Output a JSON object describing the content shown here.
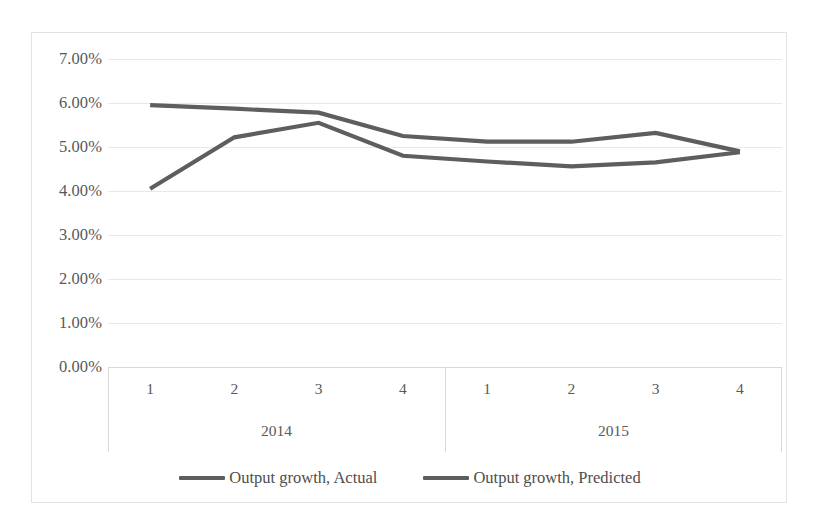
{
  "chart_data": {
    "type": "line",
    "title": "",
    "subtitle": "",
    "xlabel": "",
    "ylabel": "",
    "grid": true,
    "legend_position": "bottom",
    "ylim": [
      0,
      7
    ],
    "ytick_labels": [
      "7.00%",
      "6.00%",
      "5.00%",
      "4.00%",
      "3.00%",
      "2.00%",
      "1.00%",
      "0.00%"
    ],
    "ytick_values": [
      7,
      6,
      5,
      4,
      3,
      2,
      1,
      0
    ],
    "ytick_format": "percent",
    "categories": [
      "1",
      "2",
      "3",
      "4",
      "1",
      "2",
      "3",
      "4"
    ],
    "category_groups": [
      {
        "label": "2014",
        "span": 4
      },
      {
        "label": "2015",
        "span": 4
      }
    ],
    "x": [
      "2014 Q1",
      "2014 Q2",
      "2014 Q3",
      "2014 Q4",
      "2015 Q1",
      "2015 Q2",
      "2015 Q3",
      "2015 Q4"
    ],
    "series": [
      {
        "name": "Output growth, Actual",
        "color": "#5e5e5e",
        "values": [
          4.05,
          5.22,
          5.55,
          4.8,
          4.67,
          4.56,
          4.65,
          4.88
        ]
      },
      {
        "name": "Output growth, Predicted",
        "color": "#5e5e5e",
        "values": [
          5.95,
          5.87,
          5.78,
          5.25,
          5.12,
          5.12,
          5.32,
          4.9
        ]
      }
    ]
  },
  "legend": {
    "items": [
      {
        "label": "Output growth, Actual",
        "color": "#5e5e5e"
      },
      {
        "label": "Output growth, Predicted",
        "color": "#5e5e5e"
      }
    ]
  },
  "colors": {
    "line": "#5e5e5e",
    "gridline": "#e8e8e8",
    "axis": "#d9d9d9",
    "text": "#585858",
    "border": "#e3e3e3",
    "background": "#ffffff"
  }
}
